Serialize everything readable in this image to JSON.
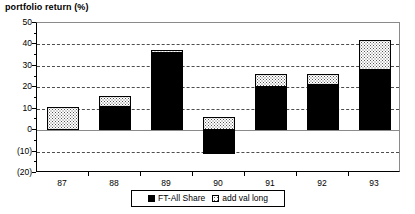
{
  "chart_data": {
    "type": "bar",
    "title": "portfolio return (%)",
    "xlabel": "",
    "ylabel": "",
    "stacked": true,
    "grid": true,
    "legend_position": "bottom",
    "ylim": [
      -20,
      50
    ],
    "ytick_step": 10,
    "categories": [
      "87",
      "88",
      "89",
      "90",
      "91",
      "92",
      "93"
    ],
    "ytick_labels": [
      "50",
      "40",
      "30",
      "20",
      "10",
      "0",
      "(10)",
      "(20)"
    ],
    "ytick_values": [
      50,
      40,
      30,
      20,
      10,
      0,
      -10,
      -20
    ],
    "series": [
      {
        "name": "FT-All Share",
        "fill": "black",
        "values": [
          0,
          11,
          36,
          -11,
          20,
          21,
          28
        ]
      },
      {
        "name": "add val long",
        "fill": "white-dotted",
        "values": [
          11,
          5,
          1.5,
          6,
          6,
          5,
          14
        ]
      }
    ],
    "totals": [
      11,
      16,
      37.5,
      6,
      26,
      26,
      42
    ],
    "colors": {
      "ft_all_share": "#000000",
      "add_val_long": "#ffffff",
      "gridline": "#4d4d4d",
      "axis": "#000000",
      "background": "#ffffff"
    }
  },
  "legend": {
    "items": [
      {
        "label": "FT-All Share"
      },
      {
        "label": "add val long"
      }
    ]
  }
}
